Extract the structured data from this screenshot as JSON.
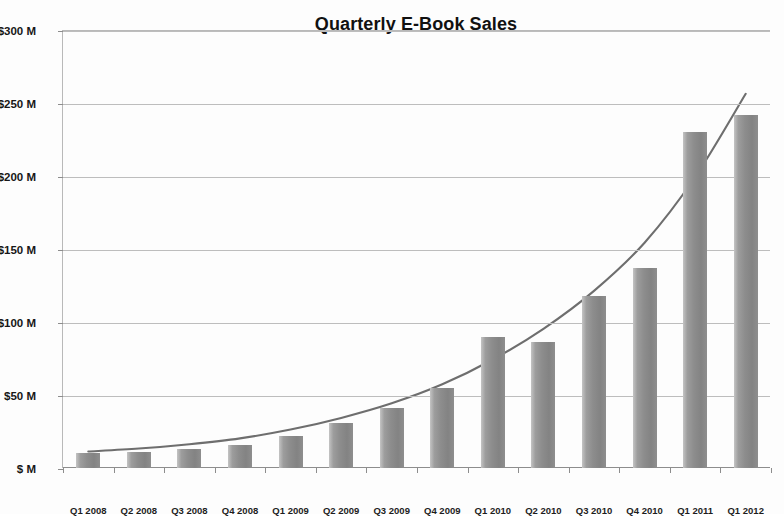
{
  "chart_data": {
    "type": "bar",
    "title": "Quarterly E-Book Sales",
    "xlabel": "",
    "ylabel": "",
    "ylim": [
      0,
      300
    ],
    "ytick_labels": [
      "$ M",
      "$50 M",
      "$100 M",
      "$150 M",
      "$200 M",
      "$250 M",
      "$300 M"
    ],
    "ytick_values": [
      0,
      50,
      100,
      150,
      200,
      250,
      300
    ],
    "grid": true,
    "legend": "none",
    "units": "Millions of US dollars",
    "categories": [
      "Q1 2008",
      "Q2 2008",
      "Q3 2008",
      "Q4 2008",
      "Q1 2009",
      "Q2 2009",
      "Q3 2009",
      "Q4 2009",
      "Q1 2010",
      "Q2 2010",
      "Q3 2010",
      "Q4 2010",
      "Q1 2011",
      "Q1 2012"
    ],
    "values": [
      10,
      11,
      13,
      16,
      22,
      31,
      41,
      55,
      90,
      86,
      118,
      137,
      230,
      242
    ],
    "series": [
      {
        "name": "Quarterly E-Book Sales",
        "values": [
          10,
          11,
          13,
          16,
          22,
          31,
          41,
          55,
          90,
          86,
          118,
          137,
          230,
          242
        ]
      }
    ],
    "annotations": [
      {
        "name": "trend-curve",
        "type": "smooth-trend-line",
        "description": "Exponential growth trend curve drawn over the bars",
        "points": [
          {
            "x": "Q1 2008",
            "y": 12
          },
          {
            "x": "Q2 2008",
            "y": 14
          },
          {
            "x": "Q3 2008",
            "y": 17
          },
          {
            "x": "Q4 2008",
            "y": 21
          },
          {
            "x": "Q1 2009",
            "y": 27
          },
          {
            "x": "Q2 2009",
            "y": 35
          },
          {
            "x": "Q3 2009",
            "y": 45
          },
          {
            "x": "Q4 2009",
            "y": 58
          },
          {
            "x": "Q1 2010",
            "y": 75
          },
          {
            "x": "Q2 2010",
            "y": 96
          },
          {
            "x": "Q3 2010",
            "y": 122
          },
          {
            "x": "Q4 2010",
            "y": 155
          },
          {
            "x": "Q1 2011",
            "y": 200
          },
          {
            "x": "Q1 2012",
            "y": 257
          }
        ]
      }
    ],
    "colors": {
      "bar_fill": "#8d8d8d",
      "bar_highlight": "#c4c4c4",
      "trend_line": "#6e6e6e",
      "gridline": "#bdbdbd",
      "axis": "#8d8d8d",
      "text": "#171717",
      "background": "#fdfdfd"
    }
  }
}
